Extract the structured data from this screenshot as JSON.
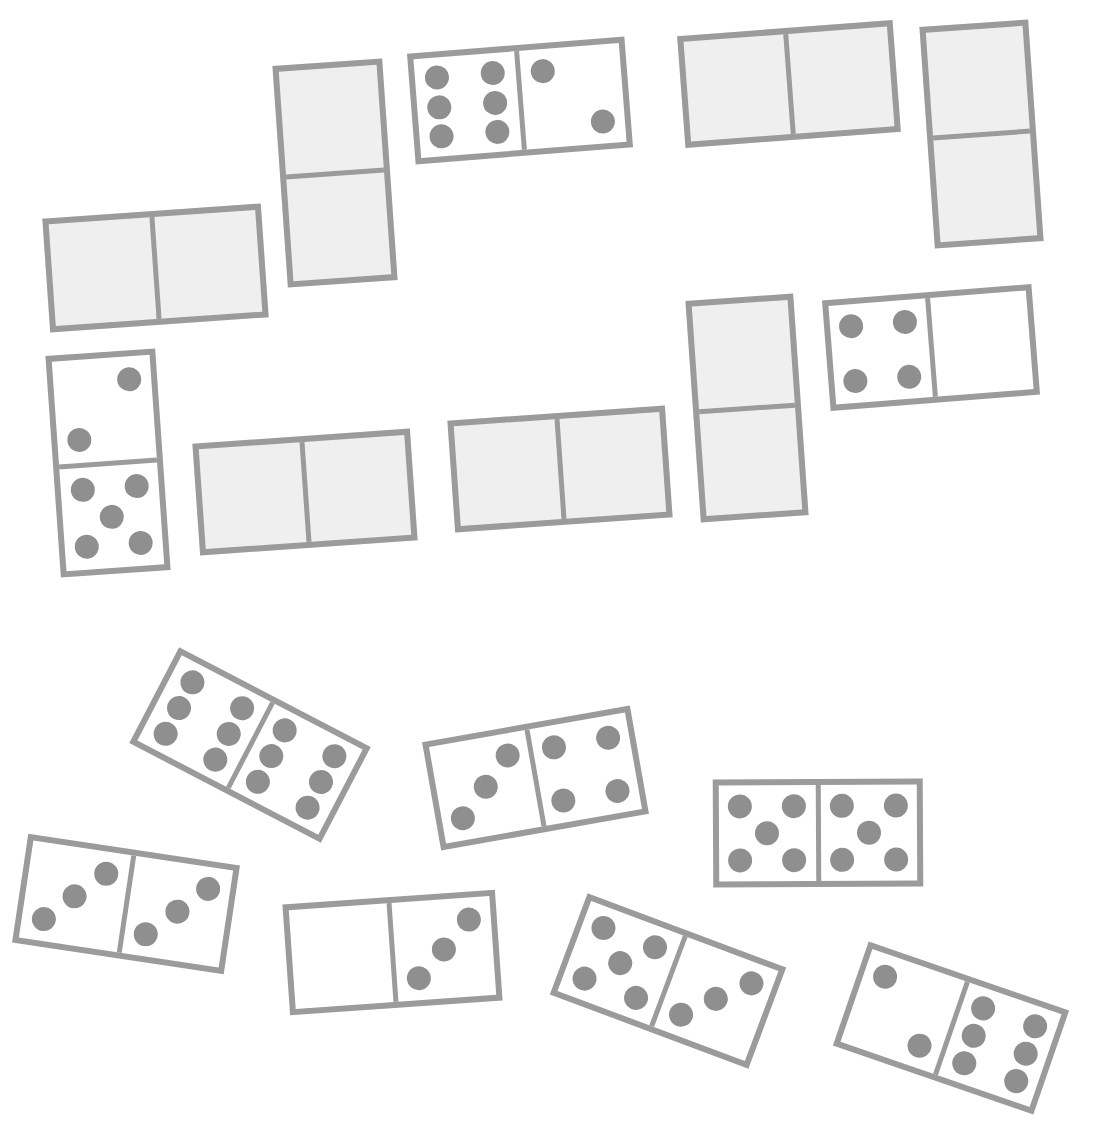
{
  "board": {
    "colors": {
      "background": "#ffffff",
      "border": "#9b9b9b",
      "pip": "#8f8f8f",
      "blank_fill": "#efefef",
      "face_fill": "#ffffff"
    },
    "dominoes": [
      {
        "id": "d1",
        "orientation": "horizontal",
        "cx": 155,
        "cy": 268,
        "w": 219,
        "h": 114,
        "angle": -4,
        "values": [
          null,
          null
        ],
        "label": "blank domino"
      },
      {
        "id": "d2",
        "orientation": "vertical",
        "cx": 335,
        "cy": 173,
        "w": 110,
        "h": 222,
        "angle": -4,
        "values": [
          null,
          null
        ],
        "label": "blank domino"
      },
      {
        "id": "d3",
        "orientation": "horizontal",
        "cx": 520,
        "cy": 100,
        "w": 218,
        "h": 111,
        "angle": -4.5,
        "values": [
          6,
          2
        ],
        "label": "6-2 domino"
      },
      {
        "id": "d4",
        "orientation": "horizontal",
        "cx": 789,
        "cy": 84,
        "w": 216,
        "h": 112,
        "angle": -4.3,
        "values": [
          null,
          null
        ],
        "label": "blank domino"
      },
      {
        "id": "d5",
        "orientation": "vertical",
        "cx": 981,
        "cy": 134,
        "w": 109,
        "h": 222,
        "angle": -4,
        "values": [
          null,
          null
        ],
        "label": "blank domino"
      },
      {
        "id": "d6",
        "orientation": "vertical",
        "cx": 108,
        "cy": 463,
        "w": 110,
        "h": 222,
        "angle": -4,
        "values": [
          2,
          5
        ],
        "label": "2-5 domino"
      },
      {
        "id": "d7",
        "orientation": "horizontal",
        "cx": 305,
        "cy": 492,
        "w": 218,
        "h": 112,
        "angle": -4,
        "values": [
          null,
          null
        ],
        "label": "blank domino"
      },
      {
        "id": "d8",
        "orientation": "horizontal",
        "cx": 560,
        "cy": 469,
        "w": 218,
        "h": 112,
        "angle": -4,
        "values": [
          null,
          null
        ],
        "label": "blank domino"
      },
      {
        "id": "d9",
        "orientation": "vertical",
        "cx": 747,
        "cy": 408,
        "w": 108,
        "h": 222,
        "angle": -4,
        "values": [
          null,
          null
        ],
        "label": "blank domino"
      },
      {
        "id": "d10",
        "orientation": "horizontal",
        "cx": 931,
        "cy": 347,
        "w": 210,
        "h": 111,
        "angle": -4.5,
        "values": [
          4,
          0
        ],
        "label": "4-0 domino"
      },
      {
        "id": "d11",
        "orientation": "horizontal",
        "cx": 250,
        "cy": 745,
        "w": 216,
        "h": 108,
        "angle": 27.5,
        "values": [
          6,
          6
        ],
        "label": "6-6 domino"
      },
      {
        "id": "d12",
        "orientation": "horizontal",
        "cx": 535,
        "cy": 778,
        "w": 211,
        "h": 110,
        "angle": -10,
        "values": [
          3,
          4
        ],
        "label": "3-4 domino"
      },
      {
        "id": "d13",
        "orientation": "horizontal",
        "cx": 818,
        "cy": 833,
        "w": 210,
        "h": 108,
        "angle": -0.3,
        "values": [
          5,
          5
        ],
        "label": "5-5 domino"
      },
      {
        "id": "d14",
        "orientation": "horizontal",
        "cx": 126,
        "cy": 904,
        "w": 214,
        "h": 110,
        "angle": 8.5,
        "values": [
          3,
          3
        ],
        "label": "3-3 domino"
      },
      {
        "id": "d15",
        "orientation": "horizontal",
        "cx": 392,
        "cy": 952,
        "w": 213,
        "h": 111,
        "angle": -4,
        "values": [
          0,
          3
        ],
        "label": "0-3 domino"
      },
      {
        "id": "d16",
        "orientation": "horizontal",
        "cx": 668,
        "cy": 981,
        "w": 212,
        "h": 108,
        "angle": 20.5,
        "values": [
          5,
          3
        ],
        "label": "5-3 domino"
      },
      {
        "id": "d17",
        "orientation": "horizontal",
        "cx": 951,
        "cy": 1028,
        "w": 212,
        "h": 110,
        "angle": 19,
        "values": [
          2,
          6
        ],
        "label": "2-6 domino"
      }
    ]
  }
}
